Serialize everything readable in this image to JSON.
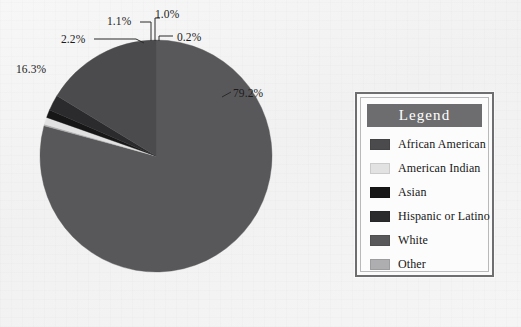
{
  "figure": {
    "background_color": "#f3f3f3",
    "text_color": "#1b1b1b"
  },
  "legend": {
    "title": "Legend",
    "title_bar_color": "#6d6d6f",
    "title_text_color": "#ffffff",
    "border_color": "#6e6e70",
    "background_color": "#fbfbfb",
    "entries": [
      {
        "label": "African American",
        "color": "#4b4b4d"
      },
      {
        "label": "American Indian",
        "color": "#e2e2e2"
      },
      {
        "label": "Asian",
        "color": "#171717"
      },
      {
        "label": "Hispanic or Latino",
        "color": "#2b2b2d"
      },
      {
        "label": "White",
        "color": "#58585a"
      },
      {
        "label": "Other",
        "color": "#aeaeb0"
      }
    ]
  },
  "pie": {
    "center_x": 156,
    "center_y": 156,
    "radius": 116,
    "start_angle_deg": 0,
    "direction": "clockwise"
  },
  "callouts": [
    {
      "key": "white",
      "text": "79.2%",
      "x": 233,
      "y": 87
    },
    {
      "key": "other",
      "text": "0.2%",
      "x": 177,
      "y": 31
    },
    {
      "key": "american-indian",
      "text": "1.0%",
      "x": 155,
      "y": 8
    },
    {
      "key": "asian",
      "text": "1.1%",
      "x": 107,
      "y": 15
    },
    {
      "key": "hispanic-latino",
      "text": "2.2%",
      "x": 61,
      "y": 33
    },
    {
      "key": "african-american",
      "text": "16.3%",
      "x": 16,
      "y": 63
    }
  ],
  "chart_data": {
    "type": "pie",
    "title": "",
    "subtitle": "",
    "categories": [
      "White",
      "Other",
      "American Indian",
      "Asian",
      "Hispanic or Latino",
      "African American"
    ],
    "values": [
      79.2,
      0.2,
      1.0,
      1.1,
      2.2,
      16.3
    ],
    "value_unit": "percent",
    "data_labels": [
      "79.2%",
      "0.2%",
      "1.0%",
      "1.1%",
      "2.2%",
      "16.3%"
    ],
    "colors": [
      "#58585a",
      "#aeaeb0",
      "#e2e2e2",
      "#171717",
      "#2b2b2d",
      "#4b4b4d"
    ],
    "legend_entries": [
      "African American",
      "American Indian",
      "Asian",
      "Hispanic or Latino",
      "White",
      "Other"
    ],
    "legend_title": "Legend",
    "legend_position": "right",
    "start_angle_deg": 0,
    "direction": "clockwise",
    "total": 100.0,
    "grid": false,
    "xlabel": "",
    "ylabel": ""
  }
}
